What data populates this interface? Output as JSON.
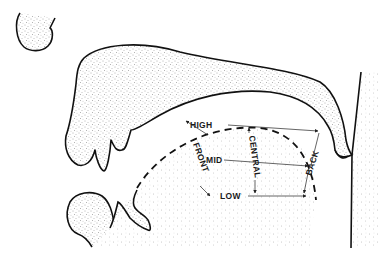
{
  "diagram": {
    "type": "vowel-space-sagittal-section",
    "labels": {
      "high": "HIGH",
      "mid": "MID",
      "low": "LOW",
      "front": "FRONT",
      "central": "CENTRAL",
      "back": "BACK"
    },
    "colors": {
      "ink": "#111111",
      "stipple": "#555555",
      "background": "#ffffff"
    }
  }
}
